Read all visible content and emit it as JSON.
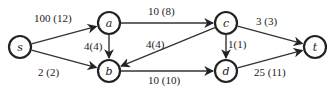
{
  "diagram": {
    "title": "",
    "type": "flow-network",
    "colors": {
      "stroke": "#222222",
      "background": "#ffffff"
    },
    "nodes": [
      {
        "id": "s",
        "label": "s",
        "x": 20,
        "y": 47
      },
      {
        "id": "a",
        "label": "a",
        "x": 109,
        "y": 23
      },
      {
        "id": "b",
        "label": "b",
        "x": 109,
        "y": 71
      },
      {
        "id": "c",
        "label": "c",
        "x": 226,
        "y": 23
      },
      {
        "id": "d",
        "label": "d",
        "x": 226,
        "y": 71
      },
      {
        "id": "t",
        "label": "t",
        "x": 315,
        "y": 47
      }
    ],
    "edges": [
      {
        "from": "s",
        "to": "a",
        "capacity": 100,
        "flow": 12,
        "label": "100 (12)",
        "lx": 34,
        "ly": 22
      },
      {
        "from": "s",
        "to": "b",
        "capacity": 2,
        "flow": 2,
        "label": "2 (2)",
        "lx": 38,
        "ly": 76
      },
      {
        "from": "a",
        "to": "b",
        "capacity": 4,
        "flow": 4,
        "label": "4(4)",
        "lx": 84,
        "ly": 50
      },
      {
        "from": "a",
        "to": "c",
        "capacity": 10,
        "flow": 8,
        "label": "10 (8)",
        "lx": 148,
        "ly": 15
      },
      {
        "from": "c",
        "to": "b",
        "capacity": 4,
        "flow": 4,
        "label": "4(4)",
        "lx": 146,
        "ly": 48
      },
      {
        "from": "b",
        "to": "d",
        "capacity": 10,
        "flow": 10,
        "label": "10 (10)",
        "lx": 148,
        "ly": 84
      },
      {
        "from": "c",
        "to": "d",
        "capacity": 1,
        "flow": 1,
        "label": "1(1)",
        "lx": 228,
        "ly": 48
      },
      {
        "from": "c",
        "to": "t",
        "capacity": 3,
        "flow": 3,
        "label": "3 (3)",
        "lx": 256,
        "ly": 25
      },
      {
        "from": "d",
        "to": "t",
        "capacity": 25,
        "flow": 11,
        "label": "25 (11)",
        "lx": 254,
        "ly": 76
      }
    ]
  }
}
